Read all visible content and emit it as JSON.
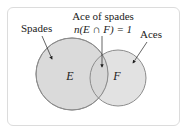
{
  "diagram": {
    "type": "venn",
    "labels": {
      "spades": "Spades",
      "intersection_title": "Ace of spades",
      "intersection_formula": "n(E ∩ F) = 1",
      "aces": "Aces"
    },
    "sets": [
      {
        "id": "E",
        "label": "E",
        "description": "Spades"
      },
      {
        "id": "F",
        "label": "F",
        "description": "Aces"
      }
    ],
    "intersection": {
      "sets": [
        "E",
        "F"
      ],
      "count": 1,
      "description": "Ace of spades"
    },
    "colors": {
      "circle_fill": "#d6d6d6",
      "circle_stroke": "#8c8c8c",
      "frame_border": "#dcdcdc",
      "text": "#222222"
    }
  }
}
